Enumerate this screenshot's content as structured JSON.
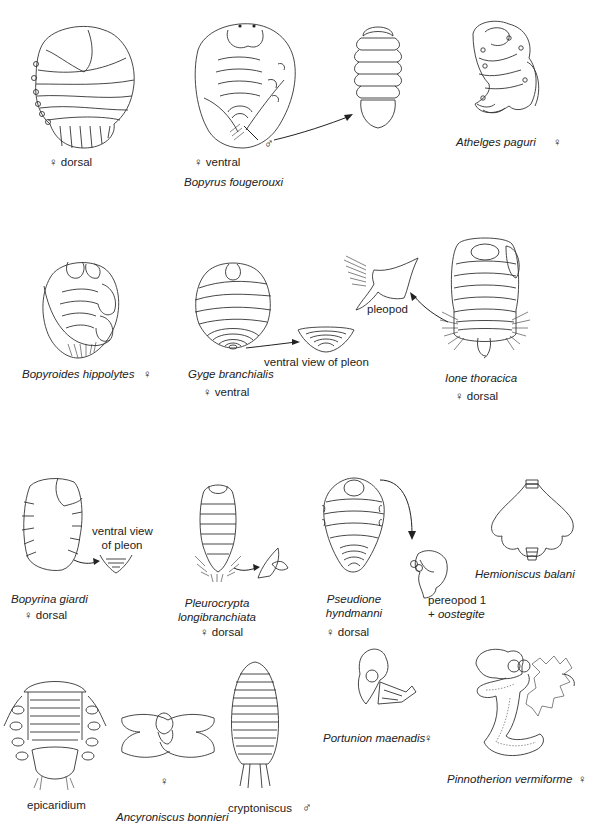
{
  "figure": {
    "row1": {
      "bopyrus_dorsal": {
        "sex_view": "♀ dorsal"
      },
      "bopyrus_ventral": {
        "sex_view": "♀  ventral",
        "male_label": "♂",
        "species": "Bopyrus fougerouxi"
      },
      "athelges": {
        "species": "Athelges paguri",
        "sex": "♀"
      }
    },
    "row2": {
      "bopyroides": {
        "species": "Bopyroides hippolytes",
        "sex": "♀"
      },
      "gyge": {
        "species": "Gyge branchialis",
        "sex_view": "♀ ventral",
        "detail_label": "ventral view of pleon"
      },
      "ione": {
        "species": "Ione thoracica",
        "sex_view": "♀ dorsal",
        "detail_label": "pleopod"
      }
    },
    "row3": {
      "bopyrina": {
        "species": "Bopyrina giardi",
        "sex_view": "♀ dorsal",
        "detail_label_line1": "ventral view",
        "detail_label_line2": "of pleon"
      },
      "pleurocrypta": {
        "species_line1": "Pleurocrypta",
        "species_line2": "longibranchiata",
        "sex_view": "♀ dorsal"
      },
      "pseudione": {
        "species_line1": "Pseudione",
        "species_line2": "hyndmanni",
        "sex_view": "♀ dorsal",
        "detail_label_line1": "pereopod 1",
        "detail_label_line2_prefix": "+ ",
        "detail_label_line2_italic": "oostegite"
      },
      "hemioniscus": {
        "species": "Hemioniscus balani"
      }
    },
    "row4": {
      "epicaridium": {
        "label": "epicaridium"
      },
      "ancyroniscus": {
        "sex": "♀",
        "species": "Ancyroniscus bonnieri"
      },
      "cryptoniscus": {
        "label": "cryptoniscus",
        "sex": "♂"
      },
      "portunion": {
        "species": "Portunion maenadis",
        "sex": "♀"
      },
      "pinnotherion": {
        "species": "Pinnotherion vermiforme",
        "sex": "♀"
      }
    }
  }
}
